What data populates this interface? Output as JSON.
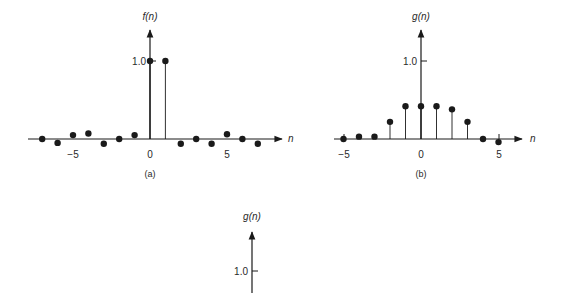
{
  "chart_data": [
    {
      "type": "stem",
      "panel": "(a)",
      "ylabel": "f(n)",
      "xlabel": "n",
      "x_ticks": [
        -5,
        0,
        5
      ],
      "y_ticks": [
        1.0
      ],
      "y_tick_labels": [
        "1.0"
      ],
      "x": [
        -7,
        -6,
        -5,
        -4,
        -3,
        -2,
        -1,
        0,
        1,
        2,
        3,
        4,
        5,
        6,
        7
      ],
      "values": [
        0.0,
        -0.05,
        0.05,
        0.07,
        -0.06,
        0.0,
        0.05,
        1.0,
        1.0,
        -0.06,
        0.0,
        -0.06,
        0.06,
        0.0,
        -0.06
      ],
      "xlim": [
        -8,
        8.5
      ],
      "ylim": [
        -0.1,
        1.3
      ],
      "caption": "(a)"
    },
    {
      "type": "stem",
      "panel": "(b)",
      "ylabel": "g(n)",
      "xlabel": "n",
      "x_ticks": [
        -5,
        0,
        5
      ],
      "y_ticks": [
        1.0
      ],
      "y_tick_labels": [
        "1.0"
      ],
      "x": [
        -5,
        -4,
        -3,
        -2,
        -1,
        0,
        1,
        2,
        3,
        4,
        5
      ],
      "values": [
        0.0,
        0.03,
        0.03,
        0.22,
        0.42,
        0.42,
        0.42,
        0.38,
        0.22,
        0.0,
        -0.04
      ],
      "xlim": [
        -5.5,
        6.5
      ],
      "ylim": [
        -0.1,
        1.3
      ],
      "caption": "(b)"
    },
    {
      "type": "stem",
      "panel": "(c)",
      "ylabel": "g(n)",
      "xlabel": "n",
      "y_ticks": [
        1.0
      ],
      "y_tick_labels": [
        "1.0"
      ],
      "x": [],
      "values": [],
      "note": "panel truncated at bottom of image; only y-axis, 1.0 tick and label visible"
    }
  ],
  "labels": {
    "a": {
      "ylabel": "f(n)",
      "xlabel": "n",
      "ytick": "1.0",
      "xticks": [
        "−5",
        "0",
        "5"
      ],
      "caption": "(a)"
    },
    "b": {
      "ylabel": "g(n)",
      "xlabel": "n",
      "ytick": "1.0",
      "xticks": [
        "−5",
        "0",
        "5"
      ],
      "caption": "(b)"
    },
    "c": {
      "ylabel": "g(n)",
      "ytick": "1.0"
    }
  },
  "colors": {
    "ink": "#1a1a1a",
    "background": "#ffffff"
  }
}
